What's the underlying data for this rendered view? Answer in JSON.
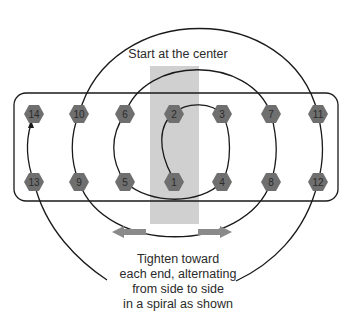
{
  "diagram": {
    "title_text": "Start at the center",
    "caption_lines": [
      "Tighten toward",
      "each end, alternating",
      "from side to side",
      "in a spiral as shown"
    ],
    "colors": {
      "nut_fill": "#6f6f6f",
      "center_band": "#d0d0d0",
      "arrow": "#8a8a8a",
      "line": "#1a1a1a"
    },
    "nuts": {
      "top_row": [
        "14",
        "10",
        "6",
        "2",
        "3",
        "7",
        "11"
      ],
      "bottom_row": [
        "13",
        "9",
        "5",
        "1",
        "4",
        "8",
        "12"
      ]
    },
    "tightening_sequence": [
      "1",
      "2",
      "3",
      "4",
      "5",
      "6",
      "7",
      "8",
      "9",
      "10",
      "11",
      "12",
      "13",
      "14"
    ],
    "arrows": {
      "left": "left-arrow",
      "right": "right-arrow"
    }
  }
}
